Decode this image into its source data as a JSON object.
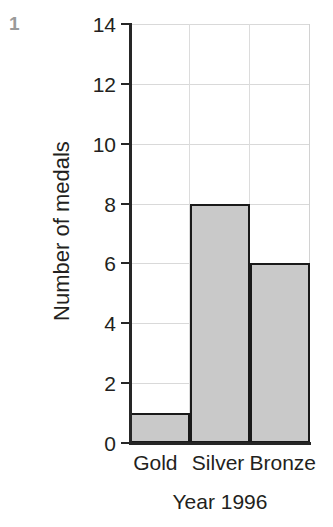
{
  "marker": {
    "label": "1",
    "color": "#9a9a9a"
  },
  "chart_data": {
    "type": "bar",
    "title": "",
    "subtitle": "",
    "categories": [
      "Gold",
      "Silver",
      "Bronze"
    ],
    "values": [
      1,
      8,
      6
    ],
    "xlabel": "Year 1996",
    "ylabel": "Number of medals",
    "ylim": [
      0,
      14
    ],
    "ytick_step": 2,
    "yticks": [
      0,
      2,
      4,
      6,
      8,
      10,
      12,
      14
    ],
    "ytick_labels": [
      "0",
      "2",
      "4",
      "6",
      "8",
      "10",
      "12",
      "14"
    ],
    "grid": true,
    "grid_axis": "both",
    "legend": false,
    "legend_position": "none",
    "bar_fill_color": "#c9c9c9",
    "bar_edge_color": "#1a1a1a",
    "gridline_color": "#d9d9d9",
    "axis_color": "#262626",
    "bar_gap": 0,
    "annotations": []
  }
}
